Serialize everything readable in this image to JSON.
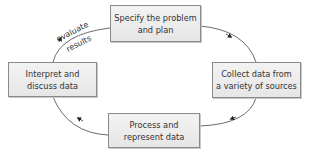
{
  "diagram": {
    "type": "cycle",
    "nodes": [
      {
        "id": "specify",
        "label": "Specify the problem\nand plan"
      },
      {
        "id": "collect",
        "label": "Collect data from\na variety of sources"
      },
      {
        "id": "process",
        "label": "Process and\nrepresent data"
      },
      {
        "id": "interpret",
        "label": "Interpret and\ndiscuss data"
      }
    ],
    "edges": [
      {
        "from": "specify",
        "to": "collect"
      },
      {
        "from": "collect",
        "to": "process"
      },
      {
        "from": "process",
        "to": "interpret"
      },
      {
        "from": "interpret",
        "to": "specify",
        "label": "evaluate results"
      }
    ],
    "edge_label": {
      "line1": "evaluate",
      "line2": "results"
    }
  }
}
